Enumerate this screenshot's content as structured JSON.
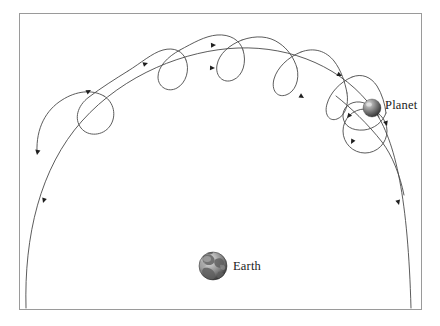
{
  "figure": {
    "type": "diagram",
    "background_color": "#ffffff",
    "frame": {
      "name": "figure-border",
      "color": "#9a9a9a",
      "stroke_width": 1,
      "x": 19,
      "y": 13,
      "width": 403,
      "height": 297
    },
    "bodies": [
      {
        "id": "planet",
        "label": "Planet",
        "cx": 372,
        "cy": 108,
        "radius": 9,
        "fill_light": "#b8b8b8",
        "fill_dark": "#3d3d3d",
        "highlight": "#e0e0e0",
        "label_x": 385,
        "label_y": 98
      },
      {
        "id": "earth",
        "label": "Earth",
        "cx": 213,
        "cy": 266,
        "radius": 14,
        "fill_light": "#d8d8d8",
        "fill_dark": "#303030",
        "highlight": "#f0f0f0",
        "label_x": 233,
        "label_y": 259
      }
    ],
    "paths": {
      "deferent": {
        "name": "deferent-arc",
        "color": "#4a4a4a",
        "stroke_width": 0.9,
        "description": "large smooth arc from bottom-left to bottom-right passing over the Earth"
      },
      "epicyclic_track": {
        "name": "epicyclic-looping-path",
        "color": "#4a4a4a",
        "stroke_width": 0.9,
        "loop_count": 6,
        "description": "looping cycloid-like curve with six retrograde loops"
      },
      "epicycle_circle": {
        "name": "planet-epicycle-circle",
        "color": "#4a4a4a",
        "stroke_width": 0.9,
        "cx": 365,
        "cy": 131,
        "radius": 22
      }
    },
    "direction_arrows": [
      {
        "name": "arrow-path-end-left",
        "x": 37,
        "y": 155,
        "angle": 100
      },
      {
        "name": "arrow-deferent-left",
        "x": 43,
        "y": 203,
        "angle": 108
      },
      {
        "name": "arrow-loop-1",
        "x": 91,
        "y": 90,
        "angle": -28
      },
      {
        "name": "arrow-loop-2",
        "x": 148,
        "y": 63,
        "angle": -18
      },
      {
        "name": "arrow-loop-3",
        "x": 216,
        "y": 45,
        "angle": -3
      },
      {
        "name": "arrow-deferent-mid",
        "x": 215,
        "y": 68,
        "angle": 2
      },
      {
        "name": "arrow-loop-4",
        "x": 304,
        "y": 98,
        "angle": 32
      },
      {
        "name": "arrow-loop-5",
        "x": 342,
        "y": 76,
        "angle": 26
      },
      {
        "name": "arrow-epicycle-top",
        "x": 347,
        "y": 118,
        "angle": 130
      },
      {
        "name": "arrow-epicycle-left",
        "x": 351,
        "y": 144,
        "angle": 118
      },
      {
        "name": "arrow-epicycle-right",
        "x": 387,
        "y": 126,
        "angle": 72
      },
      {
        "name": "arrow-deferent-right",
        "x": 399,
        "y": 205,
        "angle": 75
      }
    ]
  }
}
